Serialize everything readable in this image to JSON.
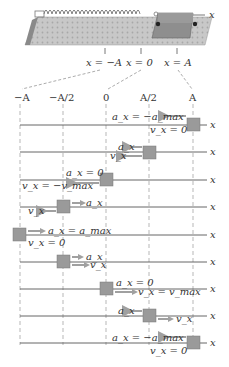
{
  "figure": {
    "apparatus": {
      "description": "glider on air track attached to spring",
      "axis_label": "x",
      "markers": [
        "x = −A",
        "x = 0",
        "x = A"
      ]
    },
    "position_ticks": [
      "−A",
      "−A/2",
      "0",
      "A/2",
      "A"
    ],
    "axis_label": "x",
    "colors": {
      "block": "#9a9a9a",
      "arrow": "#b0b0b0",
      "line": "#555555",
      "track": "#cfcfcf"
    },
    "snapshots": [
      {
        "position": "A",
        "a_label": "a_x = −a_max",
        "v_label": "v_x = 0",
        "a_dir": "left",
        "v_dir": "none"
      },
      {
        "position": "A/2",
        "a_label": "a_x",
        "v_label": "v_x",
        "a_dir": "left",
        "v_dir": "left"
      },
      {
        "position": "0",
        "a_label": "a_x = 0",
        "v_label": "v_x = −v_max",
        "a_dir": "none",
        "v_dir": "left"
      },
      {
        "position": "−A/2",
        "a_label": "a_x",
        "v_label": "v_x",
        "a_dir": "right",
        "v_dir": "left"
      },
      {
        "position": "−A",
        "a_label": "a_x = a_max",
        "v_label": "v_x = 0",
        "a_dir": "right",
        "v_dir": "none"
      },
      {
        "position": "−A/2",
        "a_label": "a_x",
        "v_label": "v_x",
        "a_dir": "right",
        "v_dir": "right"
      },
      {
        "position": "0",
        "a_label": "a_x = 0",
        "v_label": "v_x = v_max",
        "a_dir": "none",
        "v_dir": "right"
      },
      {
        "position": "A/2",
        "a_label": "a_x",
        "v_label": "v_x",
        "a_dir": "left",
        "v_dir": "right"
      },
      {
        "position": "A",
        "a_label": "a_x = −a_max",
        "v_label": "v_x = 0",
        "a_dir": "left",
        "v_dir": "none"
      }
    ]
  }
}
